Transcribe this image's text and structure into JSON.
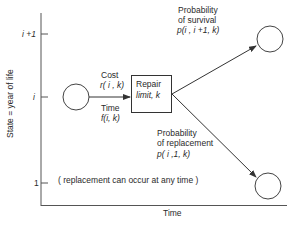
{
  "diagram": {
    "y_axis": {
      "label": "State = year of life",
      "ticks": [
        {
          "label": "i +1"
        },
        {
          "label": "i"
        },
        {
          "label": "1"
        }
      ]
    },
    "x_axis": {
      "label": "Time"
    },
    "input_arrow": {
      "cost_label": "Cost",
      "cost_expr": "r( i , k)",
      "time_label": "Time",
      "time_expr": "f(i, k)"
    },
    "repair_box": {
      "line1": "Repair",
      "line2": "limit, k"
    },
    "survival": {
      "line1": "Probability",
      "line2": "of survival",
      "expr": "p(i , i +1, k)"
    },
    "replacement": {
      "line1": "Probability",
      "line2": "of replacement",
      "expr": "p( i ,1, k)"
    },
    "note": "( replacement can occur at any time )",
    "colors": {
      "line": "#333333",
      "background": "#ffffff"
    }
  }
}
